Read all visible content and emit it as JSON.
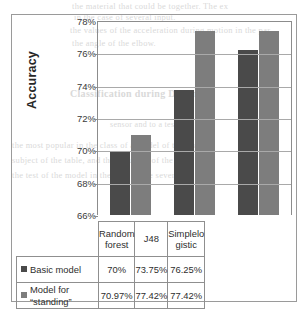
{
  "chart_data": {
    "type": "bar",
    "title": "",
    "xlabel": "",
    "ylabel": "Accuracy",
    "categories": [
      "Random\nforest",
      "J48",
      "Simplelo\ngistic"
    ],
    "series": [
      {
        "name": "Basic model",
        "color": "#4a4a4a",
        "values": [
          70,
          73.75,
          76.25
        ],
        "labels": [
          "70%",
          "73.75%",
          "76.25%"
        ]
      },
      {
        "name": "Model for\n“standing”",
        "color": "#7d7d7d",
        "values": [
          70.97,
          77.42,
          77.42
        ],
        "labels": [
          "70.97%",
          "77.42%",
          "77.42%"
        ]
      }
    ],
    "ylim": [
      66,
      78
    ],
    "ytick_labels": [
      "78%",
      "76%",
      "74%",
      "72%",
      "70%",
      "68%",
      "66%"
    ],
    "ytick_values": [
      78,
      76,
      74,
      72,
      70,
      68,
      66
    ],
    "grid": true,
    "legend_position": "table-left-column"
  },
  "ghost_text": [
    "the material that could be together. The ex",
    "in the case of several input.",
    "the values of the acceleration during motion in the par",
    "the angle of the elbow.",
    "Classification during Driving",
    "sensor and to a test",
    "the most popular in the class of a model of the test",
    "subject of the table, and the accuracy of the table 10 or",
    "the test of the model in the case of the several"
  ]
}
